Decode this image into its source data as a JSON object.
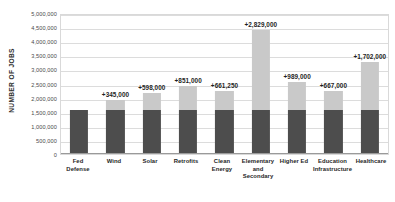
{
  "chart_data": {
    "type": "bar",
    "title": "",
    "subtitle": "",
    "xlabel": "",
    "ylabel": "NUMBER OF JOBS",
    "ylim": [
      0,
      5000000
    ],
    "ytick_step": 500000,
    "ytick_labels": [
      "5,000,000",
      "4,500,000",
      "4,000,000",
      "3,500,000",
      "3,000,000",
      "2,500,000",
      "2,000,000",
      "1,500,000",
      "1,000,000",
      "500,000",
      "0"
    ],
    "ytick_values": [
      5000000,
      4500000,
      4000000,
      3500000,
      3000000,
      2500000,
      2000000,
      1500000,
      1000000,
      500000,
      0
    ],
    "grid": true,
    "legend": "none",
    "stacked": true,
    "categories": [
      "Fed Defense",
      "Wind",
      "Solar",
      "Retrofits",
      "Clean Energy",
      "Elementary and Secondary",
      "Higher Ed",
      "Education Infrastructure",
      "Healthcare"
    ],
    "series": [
      {
        "name": "base",
        "color": "#4d4d4d",
        "values": [
          1560000,
          1560000,
          1560000,
          1560000,
          1560000,
          1560000,
          1560000,
          1560000,
          1560000
        ]
      },
      {
        "name": "additional",
        "color": "#c9c9c9",
        "values": [
          0,
          345000,
          598000,
          851000,
          661250,
          2829000,
          989000,
          667000,
          1702000
        ]
      }
    ],
    "point_labels": [
      "",
      "+345,000",
      "+598,000",
      "+851,000",
      "+661,250",
      "+2,829,000",
      "+989,000",
      "+667,000",
      "+1,702,000"
    ],
    "totals": [
      1560000,
      1905000,
      2158000,
      2411000,
      2221250,
      4389000,
      2549000,
      2227000,
      3262000
    ],
    "colors": {
      "base_segment": "#4d4d4d",
      "top_segment": "#c9c9c9",
      "gridline": "#dcdcdc",
      "axis": "#9a9a9a",
      "text": "#1f1f1f",
      "background": "#ffffff"
    }
  }
}
